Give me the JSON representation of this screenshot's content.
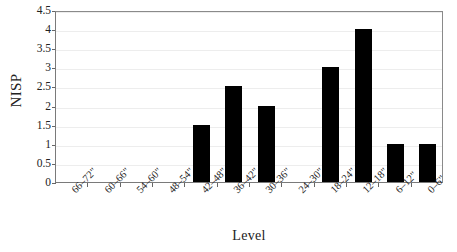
{
  "chart_data": {
    "type": "bar",
    "title": "",
    "xlabel": "Level",
    "ylabel": "NISP",
    "categories": [
      "66–72\"",
      "60–66\"",
      "54–60\"",
      "48–54\"",
      "42–48\"",
      "36–42\"",
      "30–36\"",
      "24–30\"",
      "18–24\"",
      "12–18\"",
      "6–12\"",
      "0–6\""
    ],
    "values": [
      0,
      0,
      0,
      0,
      1.5,
      2.5,
      2,
      0,
      3,
      4,
      1,
      1
    ],
    "ylim": [
      0,
      4.5
    ],
    "ytick_labels": [
      "0",
      "0.5",
      "1",
      "1.5",
      "2",
      "2.5",
      "3",
      "3.5",
      "4",
      "4.5"
    ],
    "ytick_values": [
      0,
      0.5,
      1,
      1.5,
      2,
      2.5,
      3,
      3.5,
      4,
      4.5
    ],
    "grid": true,
    "grid_axis": "y",
    "legend": false,
    "bar_color": "#000000",
    "grid_color": "#ededed",
    "axis_color": "#7a7a7a",
    "background": "#ffffff",
    "xtick_rotation": -45
  }
}
